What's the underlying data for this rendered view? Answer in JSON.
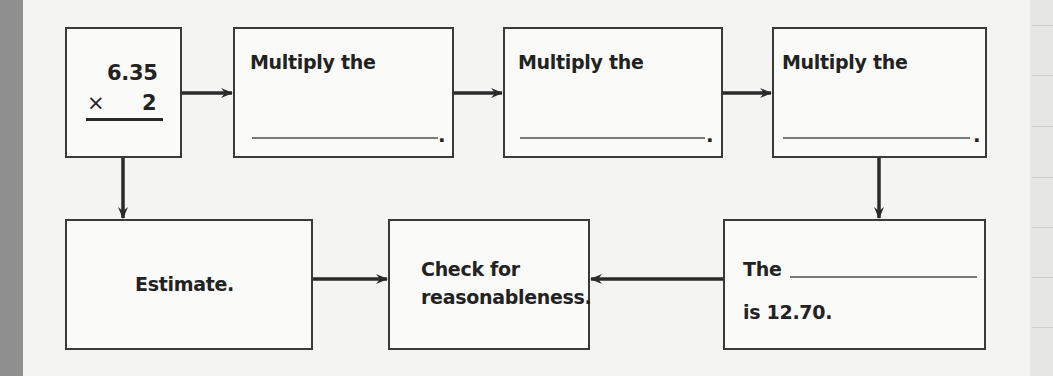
{
  "diagram": {
    "type": "flowchart",
    "accent_color": "#222222",
    "boxes": [
      {
        "id": "problem",
        "line1": "6.35",
        "operator": "×",
        "line2": "2"
      },
      {
        "id": "step1",
        "label": "Multiply the",
        "blank": "__________",
        "end": "."
      },
      {
        "id": "step2",
        "label": "Multiply the",
        "blank": "__________",
        "end": "."
      },
      {
        "id": "step3",
        "label": "Multiply the",
        "blank": "__________",
        "end": "."
      },
      {
        "id": "estimate",
        "label": "Estimate."
      },
      {
        "id": "check",
        "line1": "Check for",
        "line2": "reasonableness."
      },
      {
        "id": "result",
        "line1_prefix": "The",
        "blank": "__________",
        "line2": "is 12.70."
      }
    ],
    "connections": [
      {
        "from": "problem",
        "to": "step1",
        "direction": "right"
      },
      {
        "from": "step1",
        "to": "step2",
        "direction": "right"
      },
      {
        "from": "step2",
        "to": "step3",
        "direction": "right"
      },
      {
        "from": "step3",
        "to": "result",
        "direction": "down"
      },
      {
        "from": "problem",
        "to": "estimate",
        "direction": "down"
      },
      {
        "from": "estimate",
        "to": "check",
        "direction": "right"
      },
      {
        "from": "result",
        "to": "check",
        "direction": "left"
      }
    ]
  }
}
